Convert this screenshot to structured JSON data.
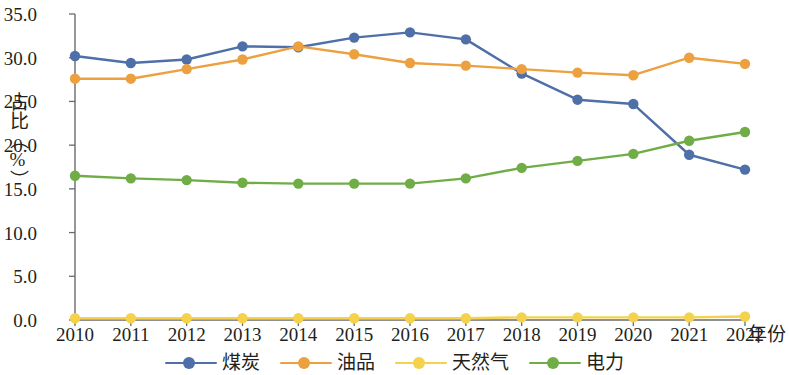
{
  "chart_data": {
    "type": "line",
    "title": "",
    "xlabel": "年份",
    "ylabel": "占比（%）",
    "x": [
      2010,
      2011,
      2012,
      2013,
      2014,
      2015,
      2016,
      2017,
      2018,
      2019,
      2020,
      2021,
      2022
    ],
    "categories": [
      "2010",
      "2011",
      "2012",
      "2013",
      "2014",
      "2015",
      "2016",
      "2017",
      "2018",
      "2019",
      "2020",
      "2021",
      "2022"
    ],
    "xlim": [
      2010,
      2022
    ],
    "ylim": [
      0.0,
      35.0
    ],
    "yticks": [
      "0.0",
      "5.0",
      "10.0",
      "15.0",
      "20.0",
      "25.0",
      "30.0",
      "35.0"
    ],
    "ytick_values": [
      0.0,
      5.0,
      10.0,
      15.0,
      20.0,
      25.0,
      30.0,
      35.0
    ],
    "grid": false,
    "legend_position": "bottom",
    "series": [
      {
        "name": "煤炭",
        "color": "#4f6fa8",
        "marker": "circle",
        "values": [
          30.2,
          29.4,
          29.8,
          31.3,
          31.2,
          32.3,
          32.9,
          32.1,
          28.2,
          25.2,
          24.7,
          18.9,
          17.2
        ]
      },
      {
        "name": "油品",
        "color": "#eda040",
        "marker": "circle",
        "values": [
          27.6,
          27.6,
          28.7,
          29.8,
          31.3,
          30.4,
          29.4,
          29.1,
          28.7,
          28.3,
          28.0,
          30.0,
          29.3
        ]
      },
      {
        "name": "天然气",
        "color": "#f5d24c",
        "marker": "circle",
        "values": [
          0.2,
          0.2,
          0.2,
          0.2,
          0.2,
          0.2,
          0.2,
          0.2,
          0.3,
          0.3,
          0.3,
          0.3,
          0.4
        ]
      },
      {
        "name": "电力",
        "color": "#70ad47",
        "marker": "circle",
        "values": [
          16.5,
          16.2,
          16.0,
          15.7,
          15.6,
          15.6,
          15.6,
          16.2,
          17.4,
          18.2,
          19.0,
          20.5,
          21.5
        ]
      }
    ]
  },
  "axes": {
    "ylabel": "占比（%）",
    "xlabel": "年份"
  },
  "legend": {
    "items": [
      {
        "label": "煤炭",
        "color": "#4f6fa8"
      },
      {
        "label": "油品",
        "color": "#eda040"
      },
      {
        "label": "天然气",
        "color": "#f5d24c"
      },
      {
        "label": "电力",
        "color": "#70ad47"
      }
    ]
  }
}
